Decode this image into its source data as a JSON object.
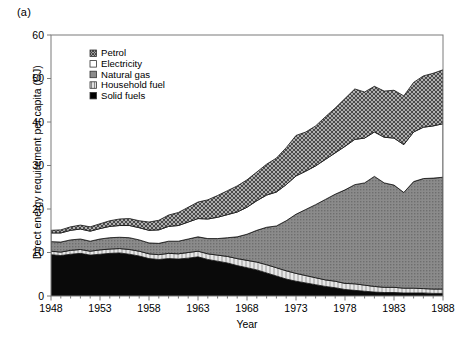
{
  "figure": {
    "panel_label": "(a)",
    "xlabel": "Year",
    "ylabel": "Direct energy requirement per capita (GJ)"
  },
  "axes": {
    "y_ticks": [
      "0",
      "10",
      "20",
      "30",
      "40",
      "50",
      "60"
    ],
    "x_ticks": [
      "1948",
      "1953",
      "1958",
      "1963",
      "1968",
      "1973",
      "1978",
      "1983",
      "1988"
    ]
  },
  "legend": {
    "items": [
      {
        "label": "Petrol",
        "swatch": "swatch-petrol-hatch",
        "color": "#6b6b6b"
      },
      {
        "label": "Electricity",
        "swatch": "swatch-electricity-white",
        "color": "#ffffff"
      },
      {
        "label": "Natural gas",
        "swatch": "swatch-natural-gas-grey",
        "color": "#808080"
      },
      {
        "label": "Household fuel",
        "swatch": "swatch-household-light",
        "color": "#d0d0d0"
      },
      {
        "label": "Solid fuels",
        "swatch": "swatch-solid-black",
        "color": "#000000"
      }
    ]
  },
  "chart_data": {
    "type": "area",
    "stacked": true,
    "title": "",
    "xlabel": "Year",
    "ylabel": "Direct energy requirement per capita (GJ)",
    "xlim": [
      1948,
      1988
    ],
    "ylim": [
      0,
      60
    ],
    "ytick_step": 10,
    "xtick_step": 5,
    "grid": false,
    "legend_position": "inside-top-left",
    "x": [
      1948,
      1949,
      1950,
      1951,
      1952,
      1953,
      1954,
      1955,
      1956,
      1957,
      1958,
      1959,
      1960,
      1961,
      1962,
      1963,
      1964,
      1965,
      1966,
      1967,
      1968,
      1969,
      1970,
      1971,
      1972,
      1973,
      1974,
      1975,
      1976,
      1977,
      1978,
      1979,
      1980,
      1981,
      1982,
      1983,
      1984,
      1985,
      1986,
      1987,
      1988
    ],
    "series": [
      {
        "name": "Solid fuels",
        "color": "#000000",
        "values": [
          9.5,
          9.3,
          9.6,
          9.8,
          9.4,
          9.6,
          9.8,
          9.9,
          9.6,
          9.2,
          8.6,
          8.4,
          8.6,
          8.5,
          8.7,
          9.0,
          8.4,
          8.0,
          7.6,
          7.0,
          6.5,
          6.0,
          5.3,
          4.6,
          3.9,
          3.4,
          3.0,
          2.6,
          2.2,
          1.9,
          1.5,
          1.3,
          1.1,
          0.9,
          0.8,
          0.8,
          0.7,
          0.7,
          0.7,
          0.6,
          0.6
        ]
      },
      {
        "name": "Household fuel",
        "color": "#d0d0d0",
        "values": [
          0.8,
          0.8,
          0.9,
          0.9,
          0.9,
          1.0,
          1.0,
          1.0,
          1.1,
          1.1,
          1.1,
          1.1,
          1.2,
          1.2,
          1.3,
          1.3,
          1.3,
          1.4,
          1.5,
          1.6,
          1.7,
          1.8,
          1.9,
          1.9,
          1.9,
          1.8,
          1.7,
          1.6,
          1.5,
          1.5,
          1.4,
          1.5,
          1.4,
          1.3,
          1.2,
          1.2,
          1.1,
          1.1,
          1.0,
          1.0,
          1.0
        ]
      },
      {
        "name": "Natural gas",
        "color": "#808080",
        "values": [
          2.2,
          2.3,
          2.4,
          2.4,
          2.3,
          2.5,
          2.6,
          2.6,
          2.7,
          2.6,
          2.5,
          2.6,
          2.8,
          2.9,
          3.1,
          3.3,
          3.5,
          3.8,
          4.3,
          5.0,
          6.0,
          7.3,
          8.6,
          9.6,
          11.5,
          13.6,
          15.2,
          16.8,
          18.5,
          20.0,
          21.5,
          22.8,
          23.5,
          25.3,
          24.0,
          23.5,
          22.0,
          24.5,
          25.3,
          25.5,
          25.7
        ]
      },
      {
        "name": "Electricity",
        "color": "#ffffff",
        "values": [
          2.0,
          2.1,
          2.2,
          2.3,
          2.3,
          2.4,
          2.6,
          2.7,
          2.8,
          2.8,
          2.9,
          3.1,
          3.4,
          3.6,
          3.9,
          4.2,
          4.5,
          4.9,
          5.3,
          5.7,
          6.2,
          6.8,
          7.4,
          7.8,
          8.3,
          8.8,
          8.8,
          8.9,
          9.2,
          9.5,
          10.0,
          10.4,
          10.3,
          10.2,
          10.5,
          10.8,
          11.0,
          11.4,
          11.8,
          12.0,
          12.3
        ]
      },
      {
        "name": "Petrol",
        "color": "#6b6b6b",
        "values": [
          0.6,
          0.7,
          0.8,
          0.9,
          1.0,
          1.1,
          1.3,
          1.5,
          1.6,
          1.6,
          1.9,
          2.2,
          2.6,
          3.0,
          3.4,
          3.8,
          4.4,
          5.0,
          5.5,
          6.0,
          6.3,
          6.6,
          7.1,
          7.8,
          8.5,
          9.3,
          9.0,
          9.2,
          9.8,
          10.3,
          11.0,
          11.6,
          10.6,
          10.5,
          10.6,
          11.0,
          11.2,
          11.4,
          11.8,
          12.1,
          12.4
        ]
      }
    ]
  }
}
